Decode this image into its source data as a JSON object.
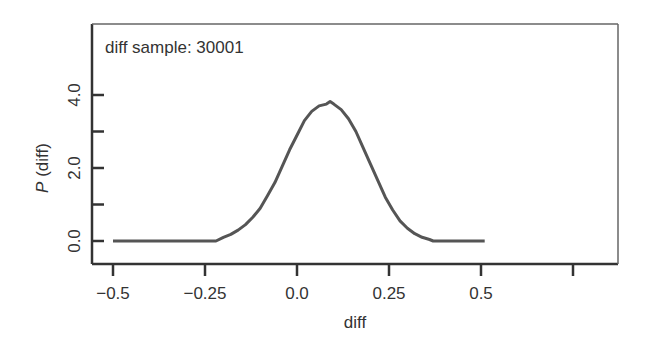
{
  "chart_data": {
    "type": "line",
    "title": "",
    "annotation": "diff sample: 30001",
    "xlabel": "diff",
    "ylabel_italic": "P",
    "ylabel_rest": " (diff)",
    "xlim": [
      -0.58,
      0.88
    ],
    "ylim": [
      -0.6,
      5.9
    ],
    "x_ticks": [
      {
        "value": -0.5,
        "label": "−0.5"
      },
      {
        "value": -0.25,
        "label": "−0.25"
      },
      {
        "value": 0.0,
        "label": "0.0"
      },
      {
        "value": 0.25,
        "label": "0.25"
      },
      {
        "value": 0.5,
        "label": "0.5"
      },
      {
        "value": 0.75,
        "label": ""
      }
    ],
    "y_ticks": [
      {
        "value": 0.0,
        "label": "0.0"
      },
      {
        "value": 1.0,
        "label": ""
      },
      {
        "value": 2.0,
        "label": "2.0"
      },
      {
        "value": 3.0,
        "label": ""
      },
      {
        "value": 4.0,
        "label": "4.0"
      }
    ],
    "grid": false,
    "legend": null,
    "line_color": "#555555",
    "series": [
      {
        "name": "P(diff)",
        "x": [
          -0.5,
          -0.22,
          -0.2,
          -0.18,
          -0.16,
          -0.14,
          -0.12,
          -0.1,
          -0.08,
          -0.06,
          -0.04,
          -0.02,
          0.0,
          0.02,
          0.04,
          0.06,
          0.08,
          0.09,
          0.1,
          0.12,
          0.14,
          0.16,
          0.18,
          0.2,
          0.22,
          0.24,
          0.26,
          0.28,
          0.3,
          0.32,
          0.34,
          0.36,
          0.37,
          0.51
        ],
        "y": [
          0.0,
          0.0,
          0.1,
          0.18,
          0.3,
          0.45,
          0.65,
          0.9,
          1.25,
          1.6,
          2.05,
          2.5,
          2.9,
          3.3,
          3.55,
          3.7,
          3.75,
          3.82,
          3.75,
          3.6,
          3.35,
          3.0,
          2.55,
          2.1,
          1.65,
          1.2,
          0.85,
          0.55,
          0.35,
          0.2,
          0.1,
          0.04,
          0.0,
          0.0
        ]
      }
    ]
  }
}
